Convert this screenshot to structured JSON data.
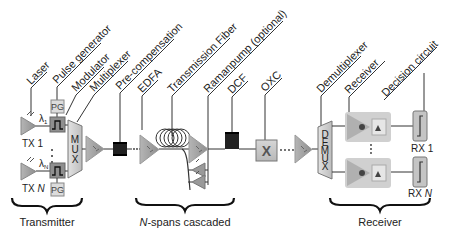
{
  "diagram": {
    "type": "optical communication system block diagram",
    "colors": {
      "component_fill": "#a8a8a8",
      "component_stroke": "#777777",
      "line": "#333333",
      "fiber_spool": "#222222",
      "text": "#222222",
      "background": "#ffffff"
    },
    "labels": {
      "laser": "Laser",
      "pulse_generator": "Pulse generator",
      "modulator": "Modulator",
      "multiplexer": "Multiplexer",
      "pre_compensation": "Pre-compensation",
      "edfa": "EDFA",
      "transmission_fiber": "Transmission Fiber",
      "raman_pump": "Ramanpump  (optional)",
      "dcf": "DCF",
      "oxc": "OXC",
      "demultiplexer": "Demultiplexer",
      "receiver": "Receiver",
      "decision_circuit": "Decision circuit"
    },
    "blocks": {
      "pg_top": "PG",
      "pg_bottom": "PG",
      "mux": [
        "M",
        "U",
        "X"
      ],
      "demux": [
        "D",
        "E",
        "M",
        "U",
        "X"
      ],
      "oxc_symbol": "X",
      "tx1": "TX 1",
      "txn_prefix": "TX ",
      "txn_suffix": "N",
      "lambda1": "λ",
      "lambda1_sub": "1",
      "lambdan": "λ",
      "lambdan_sub": "N",
      "rx1": "RX 1",
      "rxn_prefix": "RX ",
      "rxn_suffix": "N"
    },
    "sections": {
      "transmitter": "Transmitter",
      "spans_prefix": "N",
      "spans_suffix": "-spans cascaded",
      "receiver": "Receiver"
    }
  }
}
